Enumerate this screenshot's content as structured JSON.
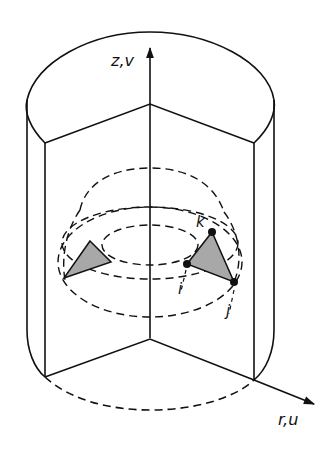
{
  "diagram": {
    "type": "axisymmetric cylinder cutaway with ring element",
    "axes": {
      "vertical_label": "z,v",
      "radial_label": "r,u"
    },
    "nodes": [
      {
        "id": "i",
        "label": "i"
      },
      {
        "id": "j",
        "label": "j"
      },
      {
        "id": "k",
        "label": "k"
      }
    ],
    "colors": {
      "line": "#111111",
      "element_fill": "#a8a8a8",
      "background": "#ffffff"
    }
  }
}
